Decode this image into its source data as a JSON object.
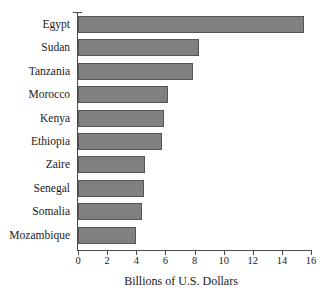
{
  "chart_data": {
    "type": "bar",
    "orientation": "horizontal",
    "title": "",
    "xlabel": "Billions of U.S. Dollars",
    "ylabel": "",
    "xlim": [
      0,
      16
    ],
    "xticks": [
      0,
      2,
      4,
      6,
      8,
      10,
      12,
      14,
      16
    ],
    "grid": false,
    "legend": null,
    "categories": [
      "Egypt",
      "Sudan",
      "Tanzania",
      "Morocco",
      "Kenya",
      "Ethiopia",
      "Zaire",
      "Senegal",
      "Somalia",
      "Mozambique"
    ],
    "values": [
      15.5,
      8.3,
      7.9,
      6.2,
      5.9,
      5.8,
      4.6,
      4.5,
      4.4,
      4.0
    ],
    "bar_color": "#808080",
    "bar_border_color": "#555555",
    "axis_color": "#4a4a4a",
    "background": "#ffffff"
  },
  "axis": {
    "x_title": "Billions of U.S. Dollars"
  }
}
